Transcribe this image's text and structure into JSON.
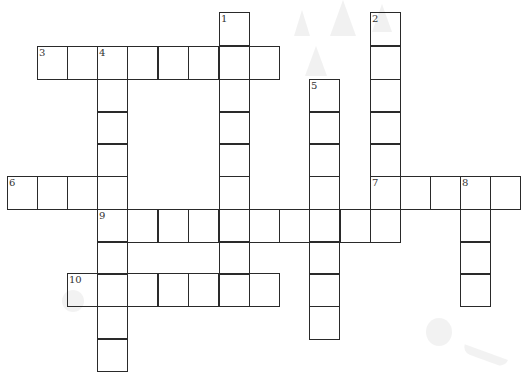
{
  "puzzle": {
    "type": "crossword",
    "grid": {
      "origin_x": 7,
      "origin_y": 12,
      "col_x": [
        7,
        37,
        67,
        97,
        127,
        158,
        188,
        219,
        249,
        279,
        309,
        340,
        370,
        400,
        430,
        460,
        490
      ],
      "row_y": [
        12,
        46,
        79,
        111,
        143,
        176,
        209,
        241,
        273,
        306,
        338
      ],
      "cell_w": 31,
      "cell_h": 34
    },
    "clue_numbers": [
      "1",
      "2",
      "3",
      "4",
      "5",
      "6",
      "7",
      "8",
      "9",
      "10"
    ],
    "entries": [
      {
        "number": "1",
        "direction": "down",
        "row": 0,
        "col": 7,
        "length": 9
      },
      {
        "number": "2",
        "direction": "down",
        "row": 0,
        "col": 12,
        "length": 7
      },
      {
        "number": "3",
        "direction": "across",
        "row": 1,
        "col": 1,
        "length": 8
      },
      {
        "number": "4",
        "direction": "down",
        "row": 1,
        "col": 3,
        "length": 10
      },
      {
        "number": "5",
        "direction": "down",
        "row": 2,
        "col": 10,
        "length": 8
      },
      {
        "number": "6",
        "direction": "across",
        "row": 5,
        "col": 0,
        "length": 4
      },
      {
        "number": "7",
        "direction": "across",
        "row": 5,
        "col": 12,
        "length": 5
      },
      {
        "number": "8",
        "direction": "down",
        "row": 5,
        "col": 15,
        "length": 4
      },
      {
        "number": "9",
        "direction": "across",
        "row": 6,
        "col": 3,
        "length": 10
      },
      {
        "number": "10",
        "direction": "across",
        "row": 8,
        "col": 2,
        "length": 7
      }
    ],
    "colors": {
      "grid_line": "#2a2a2a",
      "number_text": "#333333",
      "background": "#ffffff",
      "decoration": "#ececec"
    }
  }
}
